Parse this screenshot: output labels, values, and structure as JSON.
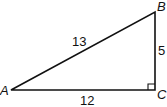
{
  "diagram": {
    "type": "right-triangle",
    "vertices": {
      "A": {
        "label": "A"
      },
      "B": {
        "label": "B"
      },
      "C": {
        "label": "C"
      }
    },
    "sides": {
      "AB": {
        "label": "13"
      },
      "BC": {
        "label": "5"
      },
      "AC": {
        "label": "12"
      }
    },
    "right_angle_at": "C",
    "stroke_color": "#111111"
  }
}
